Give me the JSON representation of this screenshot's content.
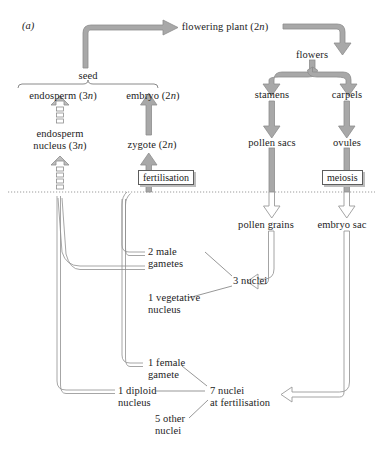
{
  "figure": {
    "panel_label": "(a)",
    "style": {
      "arrow_fill_solid": "#a8a8a8",
      "arrow_fill_hollow": "#ffffff",
      "arrow_stroke": "#8a8a8a",
      "line_stroke": "#8f8f8f",
      "thin_stroke": "#6a6a6a",
      "text_color": "#1d1d1d",
      "divider_color": "#9b9b9b",
      "box_border": "#5d5d5d",
      "box_shadow": "#bdbdbd",
      "background": "#ffffff"
    },
    "divider": {
      "name": "ploidy-divider",
      "style": "dotted",
      "y": 192
    }
  },
  "nodes": {
    "flowering_plant": {
      "text": "flowering plant (2n)",
      "ploidy": "2n",
      "x": 225,
      "y": 27
    },
    "seed": {
      "text": "seed",
      "x": 88,
      "y": 78
    },
    "endosperm": {
      "text": "endosperm (3n)",
      "ploidy": "3n",
      "x": 63,
      "y": 96
    },
    "embryo": {
      "text": "embryo (2n)",
      "ploidy": "2n",
      "x": 153,
      "y": 96
    },
    "endosperm_nucleus": {
      "text": "endosperm\nnucleus (3n)",
      "line1": "endosperm",
      "line2": "nucleus (3n)",
      "ploidy": "3n",
      "x": 60,
      "y": 138
    },
    "zygote": {
      "text": "zygote (2n)",
      "ploidy": "2n",
      "x": 152,
      "y": 145
    },
    "flowers": {
      "text": "flowers",
      "x": 312,
      "y": 55
    },
    "stamens": {
      "text": "stamens",
      "x": 272,
      "y": 95
    },
    "carpels": {
      "text": "carpels",
      "x": 347,
      "y": 95
    },
    "pollen_sacs": {
      "text": "pollen sacs",
      "x": 272,
      "y": 143
    },
    "ovules": {
      "text": "ovules",
      "x": 347,
      "y": 143
    },
    "pollen_grains": {
      "text": "pollen grains",
      "x": 266,
      "y": 225
    },
    "embryo_sac": {
      "text": "embryo sac",
      "x": 342,
      "y": 225
    },
    "two_male_gametes": {
      "line1": "2 male",
      "line2": "gametes",
      "x": 172,
      "y": 252
    },
    "one_vegetative_nucleus": {
      "line1": "1 vegetative",
      "line2": "nucleus",
      "x": 133,
      "y": 302
    },
    "three_nuclei": {
      "text": "3 nuclei",
      "x": 212,
      "y": 280
    },
    "one_female_gamete": {
      "line1": "1 female",
      "line2": "gamete",
      "x": 150,
      "y": 363
    },
    "one_diploid_nucleus": {
      "line1": "1 diploid",
      "line2": "nucleus",
      "x": 122,
      "y": 392
    },
    "five_other_nuclei": {
      "line1": "5 other",
      "line2": "nuclei",
      "x": 160,
      "y": 420
    },
    "seven_nuclei": {
      "line1": "7 nuclei",
      "line2": "at fertilisation",
      "x": 212,
      "y": 392
    }
  },
  "process_boxes": [
    {
      "name": "fertilisation-box",
      "label": "fertilisation",
      "x": 138,
      "y": 170
    },
    {
      "name": "meiosis-box",
      "label": "meiosis",
      "x": 322,
      "y": 170
    }
  ],
  "flows": [
    {
      "from": "seed",
      "to": "flowering plant (2n)",
      "style": "solid-block-arrow"
    },
    {
      "from": "flowering plant (2n)",
      "to": "flowers",
      "style": "solid-block-arrow"
    },
    {
      "from": "flowers",
      "to": "stamens",
      "style": "solid-block-arrow"
    },
    {
      "from": "flowers",
      "to": "carpels",
      "style": "solid-block-arrow"
    },
    {
      "from": "stamens",
      "to": "pollen sacs",
      "style": "solid-block-arrow"
    },
    {
      "from": "carpels",
      "to": "ovules",
      "style": "solid-block-arrow"
    },
    {
      "from": "pollen sacs",
      "to": "pollen grains",
      "style": "meiosis-arrow"
    },
    {
      "from": "ovules",
      "to": "embryo sac",
      "style": "meiosis-arrow"
    },
    {
      "from": "pollen grains",
      "to": "3 nuclei",
      "style": "thin-outline-arrow"
    },
    {
      "from": "embryo sac",
      "to": "7 nuclei at fertilisation",
      "style": "thin-outline-arrow"
    },
    {
      "from": "endosperm nucleus (3n)",
      "to": "endosperm (3n)",
      "style": "dashed-block-arrow"
    },
    {
      "from": "zygote (2n)",
      "to": "embryo (2n)",
      "style": "solid-block-arrow"
    },
    {
      "from": "fertilisation",
      "to": "endosperm nucleus (3n)",
      "style": "dashed-block-arrow"
    },
    {
      "from": "fertilisation",
      "to": "zygote (2n)",
      "style": "solid-block-arrow"
    },
    {
      "from": "2 male gametes",
      "to": "fertilisation",
      "style": "thin-outline-line"
    },
    {
      "from": "1 diploid nucleus",
      "to": "fertilisation",
      "style": "thin-outline-line"
    },
    {
      "from": "1 female gamete",
      "to": "fertilisation",
      "style": "thin-outline-line"
    }
  ],
  "groupings": [
    {
      "name": "seed-bracket",
      "label": "seed",
      "members": [
        "endosperm (3n)",
        "embryo (2n)"
      ]
    },
    {
      "name": "three-nuclei-group",
      "label": "3 nuclei",
      "members": [
        "2 male gametes",
        "1 vegetative nucleus"
      ]
    },
    {
      "name": "seven-nuclei-group",
      "label": "7 nuclei at fertilisation",
      "members": [
        "1 female gamete",
        "1 diploid nucleus",
        "5 other nuclei"
      ]
    }
  ]
}
